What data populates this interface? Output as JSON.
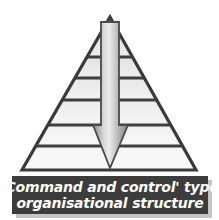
{
  "figure": {
    "background_color": "#ffffff",
    "width": 219,
    "height": 220
  },
  "pyramid": {
    "name": "hierarchical-pyramid",
    "outline_color": "#3a3a3a",
    "apex": {
      "x": 110,
      "y": 17
    },
    "base_left": {
      "x": 22,
      "y": 170
    },
    "base_right": {
      "x": 196,
      "y": 170
    },
    "tier_count": 7,
    "divider_y": [
      57,
      78,
      100,
      125,
      146
    ],
    "tier_fills": [
      "#e4e4e4",
      "#ebebeb",
      "#ededed",
      "#f0f0f0",
      "#f3f3f3",
      "#f6f6f6",
      "#fafafa"
    ]
  },
  "arrow": {
    "name": "downward-command-arrow",
    "direction": "down",
    "label": "",
    "shaft_left": 101,
    "shaft_right": 119,
    "shaft_top": 22,
    "head_top": 125,
    "head_left": 93,
    "head_right": 128,
    "tip_y": 168,
    "outline_color": "#4a4a4a",
    "fill_light": "#e8e8e8",
    "fill_mid": "#b4b4b4",
    "fill_dark": "#8f8f8f"
  },
  "caption": {
    "name": "caption-banner",
    "background_color": "#3c3c3c",
    "text_color": "#ffffff",
    "lines": [
      "'Command and control' type",
      "organisational structure"
    ],
    "full_text": "'Command and control' type organisational structure"
  }
}
